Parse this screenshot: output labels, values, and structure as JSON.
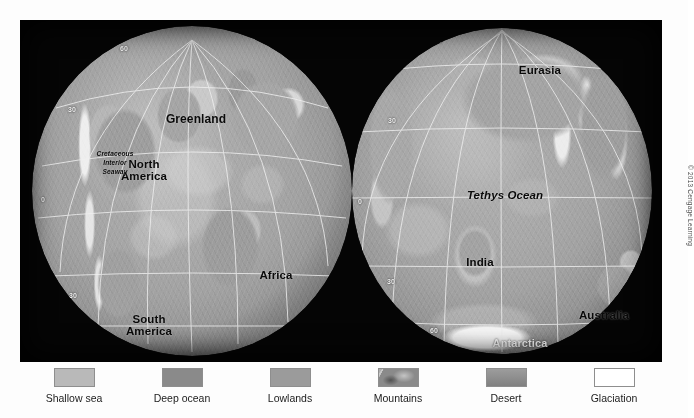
{
  "figure": {
    "copyright": "© 2013 Cengage Learning"
  },
  "globes": [
    {
      "id": "western-hemisphere",
      "labels": [
        {
          "text": "Greenland",
          "style": "dark",
          "italic": false
        },
        {
          "text": "North",
          "style": "dark",
          "italic": false
        },
        {
          "text": "America",
          "style": "dark",
          "italic": false
        },
        {
          "text": "Cretaceous",
          "style": "dark",
          "italic": true
        },
        {
          "text": "Interior",
          "style": "dark",
          "italic": true
        },
        {
          "text": "Seaway",
          "style": "dark",
          "italic": true
        },
        {
          "text": "Africa",
          "style": "dark",
          "italic": false
        },
        {
          "text": "South",
          "style": "dark",
          "italic": false
        },
        {
          "text": "America",
          "style": "dark",
          "italic": false
        }
      ],
      "graticule_ticks": [
        "60",
        "30",
        "0",
        "30"
      ]
    },
    {
      "id": "eastern-hemisphere",
      "labels": [
        {
          "text": "Eurasia",
          "style": "dark",
          "italic": false
        },
        {
          "text": "Tethys Ocean",
          "style": "dark",
          "italic": true
        },
        {
          "text": "India",
          "style": "dark",
          "italic": false
        },
        {
          "text": "Australia",
          "style": "dark",
          "italic": false
        },
        {
          "text": "Antarctica",
          "style": "light",
          "italic": false
        }
      ],
      "graticule_ticks": [
        "60",
        "30",
        "0",
        "30",
        "60"
      ]
    }
  ],
  "legend": {
    "items": [
      {
        "label": "Shallow sea",
        "swatch": "sw-shallow",
        "color": "#b9b9b9"
      },
      {
        "label": "Deep ocean",
        "swatch": "sw-deep",
        "color": "#8a8a8a"
      },
      {
        "label": "Lowlands",
        "swatch": "sw-low",
        "color": "#9b9b9b"
      },
      {
        "label": "Mountains",
        "swatch": "sw-mtn",
        "color": "#8a8a8a"
      },
      {
        "label": "Desert",
        "swatch": "sw-desert",
        "color": "#8f8f8f"
      },
      {
        "label": "Glaciation",
        "swatch": "sw-glac",
        "color": "#ffffff"
      }
    ]
  },
  "map_labels": {
    "left": {
      "greenland": "Greenland",
      "north": "North",
      "america": "America",
      "cretaceous": "Cretaceous",
      "interior": "Interior",
      "seaway": "Seaway",
      "africa": "Africa",
      "south": "South",
      "south_america": "America",
      "t60": "60",
      "t30a": "30",
      "t0": "0",
      "t30b": "30"
    },
    "right": {
      "eurasia": "Eurasia",
      "tethys": "Tethys Ocean",
      "india": "India",
      "australia": "Australia",
      "antarctica": "Antarctica",
      "t60a": "60",
      "t30a": "30",
      "t0": "0",
      "t30b": "30",
      "t60b": "60"
    }
  }
}
